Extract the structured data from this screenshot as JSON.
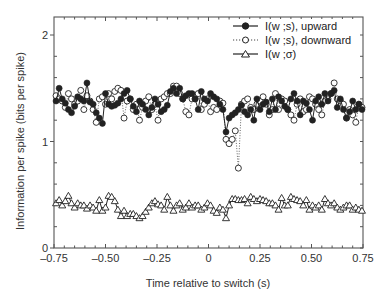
{
  "chart_data": {
    "type": "line",
    "title": "",
    "xlabel": "Time relative to switch (s)",
    "ylabel": "Information per spike (bits per spike)",
    "xlim": [
      -0.75,
      0.75
    ],
    "ylim": [
      0,
      2.2
    ],
    "xticks": [
      -0.75,
      -0.5,
      -0.25,
      0,
      0.25,
      0.5,
      0.75
    ],
    "xtick_labels": [
      "–0.75",
      "–0.50",
      "–0.25",
      "0",
      "0.25",
      "0.50",
      "0.75"
    ],
    "yticks": [
      0,
      1,
      2
    ],
    "ytick_labels": [
      "0",
      "1",
      "2"
    ],
    "grid": false,
    "legend_position": "upper right",
    "x": [
      -0.74,
      -0.725,
      -0.71,
      -0.695,
      -0.68,
      -0.665,
      -0.65,
      -0.635,
      -0.62,
      -0.605,
      -0.59,
      -0.575,
      -0.56,
      -0.545,
      -0.53,
      -0.515,
      -0.5,
      -0.485,
      -0.47,
      -0.455,
      -0.44,
      -0.425,
      -0.41,
      -0.395,
      -0.38,
      -0.365,
      -0.35,
      -0.335,
      -0.32,
      -0.305,
      -0.29,
      -0.275,
      -0.26,
      -0.245,
      -0.23,
      -0.215,
      -0.2,
      -0.185,
      -0.17,
      -0.155,
      -0.14,
      -0.125,
      -0.11,
      -0.095,
      -0.08,
      -0.065,
      -0.05,
      -0.035,
      -0.02,
      -0.005,
      0.01,
      0.025,
      0.04,
      0.055,
      0.07,
      0.085,
      0.1,
      0.115,
      0.13,
      0.145,
      0.16,
      0.175,
      0.19,
      0.205,
      0.22,
      0.235,
      0.25,
      0.265,
      0.28,
      0.295,
      0.31,
      0.325,
      0.34,
      0.355,
      0.37,
      0.385,
      0.4,
      0.415,
      0.43,
      0.445,
      0.46,
      0.475,
      0.49,
      0.505,
      0.52,
      0.535,
      0.55,
      0.565,
      0.58,
      0.595,
      0.61,
      0.625,
      0.64,
      0.655,
      0.67,
      0.685,
      0.7,
      0.715,
      0.73,
      0.745
    ],
    "series": [
      {
        "name": "I(w ;s), upward",
        "marker": "filled-circle",
        "line": "solid",
        "values": [
          1.38,
          1.5,
          1.4,
          1.36,
          1.3,
          1.27,
          1.33,
          1.42,
          1.4,
          1.38,
          1.55,
          1.37,
          1.35,
          1.27,
          1.22,
          1.17,
          1.45,
          1.35,
          1.33,
          1.34,
          1.36,
          1.4,
          1.45,
          1.48,
          1.4,
          1.33,
          1.28,
          1.38,
          1.35,
          1.3,
          1.25,
          1.32,
          1.4,
          1.35,
          1.28,
          1.3,
          1.34,
          1.47,
          1.5,
          1.45,
          1.5,
          1.4,
          1.43,
          1.45,
          1.45,
          1.4,
          1.3,
          1.47,
          1.4,
          1.38,
          1.45,
          1.42,
          1.4,
          1.35,
          1.3,
          1.09,
          1.22,
          1.25,
          1.27,
          1.3,
          1.34,
          1.28,
          1.25,
          1.3,
          1.2,
          1.4,
          1.3,
          1.35,
          1.37,
          1.28,
          1.4,
          1.3,
          1.42,
          1.38,
          1.33,
          1.3,
          1.4,
          1.45,
          1.38,
          1.25,
          1.38,
          1.36,
          1.3,
          1.2,
          1.38,
          1.42,
          1.35,
          1.45,
          1.38,
          1.45,
          1.48,
          1.32,
          1.4,
          1.3,
          1.22,
          1.28,
          1.38,
          1.3,
          1.35,
          1.3
        ]
      },
      {
        "name": "I(w ;s), downward",
        "marker": "open-circle",
        "line": "dotted",
        "values": [
          1.43,
          1.4,
          1.38,
          1.32,
          1.45,
          1.4,
          1.35,
          1.38,
          1.48,
          1.3,
          1.43,
          1.38,
          1.3,
          1.18,
          1.4,
          1.42,
          1.35,
          1.45,
          1.4,
          1.47,
          1.5,
          1.48,
          1.22,
          1.38,
          1.4,
          1.3,
          1.35,
          1.2,
          1.32,
          1.38,
          1.42,
          1.3,
          1.35,
          1.2,
          1.4,
          1.42,
          1.45,
          1.45,
          1.52,
          1.52,
          1.45,
          1.4,
          1.28,
          1.25,
          1.4,
          1.4,
          1.45,
          1.3,
          1.35,
          1.4,
          1.28,
          1.32,
          1.3,
          1.38,
          1.36,
          1.02,
          0.98,
          1.02,
          1.1,
          0.75,
          1.35,
          1.38,
          1.4,
          1.32,
          1.3,
          1.35,
          1.38,
          1.42,
          1.35,
          1.25,
          1.3,
          1.45,
          1.3,
          1.4,
          1.38,
          1.3,
          1.25,
          1.2,
          1.35,
          1.4,
          1.28,
          1.3,
          1.42,
          1.4,
          1.35,
          1.3,
          1.25,
          1.38,
          1.4,
          1.45,
          1.55,
          1.4,
          1.38,
          1.35,
          1.22,
          1.3,
          1.25,
          1.18,
          1.35,
          1.32
        ]
      },
      {
        "name": "I(w ;σ)",
        "marker": "open-triangle",
        "line": "solid",
        "values": [
          0.42,
          0.45,
          0.4,
          0.44,
          0.49,
          0.42,
          0.38,
          0.42,
          0.4,
          0.4,
          0.37,
          0.4,
          0.38,
          0.35,
          0.45,
          0.35,
          0.38,
          0.49,
          0.48,
          0.44,
          0.36,
          0.3,
          0.35,
          0.3,
          0.32,
          0.32,
          0.3,
          0.28,
          0.3,
          0.34,
          0.38,
          0.42,
          0.44,
          0.41,
          0.4,
          0.36,
          0.48,
          0.4,
          0.35,
          0.4,
          0.42,
          0.36,
          0.38,
          0.42,
          0.38,
          0.4,
          0.4,
          0.36,
          0.38,
          0.42,
          0.4,
          0.35,
          0.33,
          0.38,
          0.36,
          0.28,
          0.4,
          0.46,
          0.46,
          0.45,
          0.45,
          0.46,
          0.42,
          0.48,
          0.46,
          0.44,
          0.46,
          0.45,
          0.44,
          0.42,
          0.42,
          0.4,
          0.36,
          0.47,
          0.4,
          0.4,
          0.48,
          0.46,
          0.45,
          0.44,
          0.4,
          0.45,
          0.36,
          0.4,
          0.38,
          0.4,
          0.36,
          0.46,
          0.42,
          0.4,
          0.42,
          0.38,
          0.36,
          0.38,
          0.4,
          0.4,
          0.36,
          0.38,
          0.36,
          0.35
        ]
      }
    ]
  },
  "legend": {
    "items": [
      {
        "label": "I(w ;s), upward"
      },
      {
        "label": "I(w ;s), downward"
      },
      {
        "label": "I(w ;σ)"
      }
    ]
  },
  "colors": {
    "ink": "#222222",
    "axis": "#555555",
    "background": "#ffffff"
  }
}
